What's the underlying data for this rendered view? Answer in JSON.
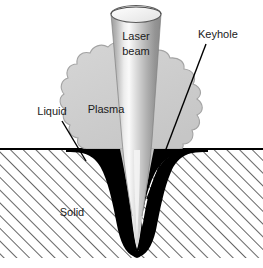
{
  "figure": {
    "background_color": "#ffffff"
  },
  "labels": {
    "laser_beam_line1": "Laser",
    "laser_beam_line2": "beam",
    "keyhole": "Keyhole",
    "plasma": "Plasma",
    "liquid": "Liquid",
    "solid": "Solid"
  },
  "colors": {
    "text": "#1a1a1a",
    "liquid_pool": "#000000",
    "plasma_cloud": "#cdcdcd",
    "plasma_outline": "#9a9a9a",
    "keyhole_cavity": "#d8d8d8",
    "beam_dark": "#8f8f8f",
    "beam_light": "#f2f2f2",
    "hatch_line": "#4a4a4a",
    "surface_line": "#000000",
    "leader_line": "#000000",
    "solid_fill": "#ffffff"
  },
  "geometry": {
    "width": 263,
    "height": 268,
    "surface_y": 149,
    "solid_bottom_y": 258,
    "hatch_angle_deg": 45,
    "keyhole_tip_y": 252,
    "beam_top_y": 4,
    "beam_axis_x": 137
  },
  "leader_lines": [
    {
      "name": "keyhole-leader",
      "x1": 206,
      "y1": 44,
      "x2": 147,
      "y2": 199
    },
    {
      "name": "liquid-leader",
      "x1": 62,
      "y1": 121,
      "x2": 86,
      "y2": 161
    }
  ]
}
